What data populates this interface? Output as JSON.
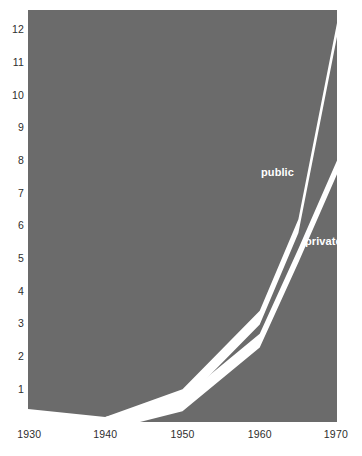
{
  "chart": {
    "background_color": "#6b6b6b",
    "line_color": "#ffffff",
    "text_color": "#2e2e2e",
    "label_color": "#ffffff"
  },
  "chart_data": {
    "type": "line",
    "title": "",
    "subtitle": "",
    "xlabel": "",
    "ylabel": "",
    "xlim": [
      1930,
      1970
    ],
    "ylim": [
      0,
      12.6
    ],
    "grid": false,
    "legend_position": "inline-on-curve",
    "style": "thick white bands on solid gray field",
    "x": [
      1930,
      1940,
      1950,
      1960,
      1965,
      1970
    ],
    "series": [
      {
        "name": "public",
        "label": "public",
        "values": [
          0.4,
          0.15,
          1.0,
          3.4,
          6.2,
          12.2
        ]
      },
      {
        "name": "private",
        "label": "private",
        "values": [
          0.1,
          0.15,
          0.75,
          2.7,
          5.3,
          8.0
        ]
      }
    ],
    "y_ticks": [
      1,
      2,
      3,
      4,
      5,
      6,
      7,
      8,
      9,
      10,
      11,
      12
    ],
    "y_tick_labels": [
      "1",
      "2",
      "3",
      "4",
      "5",
      "6",
      "7",
      "8",
      "9",
      "10",
      "11",
      "12"
    ],
    "x_ticks": [
      1930,
      1940,
      1950,
      1960,
      1970
    ],
    "x_tick_labels": [
      "1930",
      "1940",
      "1950",
      "1960",
      "1970"
    ],
    "annotations": [
      {
        "text": "public",
        "x": 1963,
        "y": 7.6
      },
      {
        "text": "private",
        "x": 1968,
        "y": 5.4
      }
    ]
  }
}
